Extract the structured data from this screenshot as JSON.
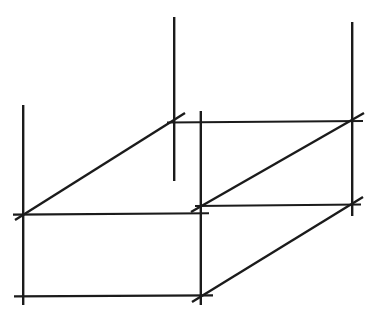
{
  "figure": {
    "projection": "oblique",
    "style": "hand-drawn technical sketch with overshooting construction lines",
    "background_color": "#ffffff",
    "line_color": "#1b1b1b",
    "line_width_px": 2.4,
    "canvas": {
      "width": 374,
      "height": 315
    },
    "vertices": {
      "front_top_left": {
        "x": 23,
        "y": 214
      },
      "front_top_right": {
        "x": 201,
        "y": 214
      },
      "front_bottom_left": {
        "x": 23,
        "y": 296
      },
      "front_bottom_right": {
        "x": 201,
        "y": 296
      },
      "back_top_left": {
        "x": 174,
        "y": 122
      },
      "back_top_right": {
        "x": 352,
        "y": 122
      },
      "back_bottom_left": {
        "x": 201,
        "y": 205
      },
      "back_bottom_right": {
        "x": 352,
        "y": 205
      }
    },
    "edges": [
      {
        "name": "front-face-top-edge",
        "from": "front_top_left",
        "to": "front_top_right",
        "kind": "horizontal"
      },
      {
        "name": "front-face-bottom-edge",
        "from": "front_bottom_left",
        "to": "front_bottom_right",
        "kind": "horizontal"
      },
      {
        "name": "front-face-left-edge",
        "from": "front_top_left",
        "to": "front_bottom_left",
        "kind": "vertical"
      },
      {
        "name": "front-face-right-edge",
        "from": "front_top_right",
        "to": "front_bottom_right",
        "kind": "vertical"
      },
      {
        "name": "back-face-top-edge",
        "from": "back_top_left",
        "to": "back_top_right",
        "kind": "horizontal"
      },
      {
        "name": "back-face-bottom-edge",
        "from": "back_bottom_left",
        "to": "back_bottom_right",
        "kind": "horizontal"
      },
      {
        "name": "back-face-left-edge",
        "from": "back_top_left",
        "to": "back_bottom_left",
        "kind": "vertical"
      },
      {
        "name": "back-face-right-edge",
        "from": "back_top_right",
        "to": "back_bottom_right",
        "kind": "vertical"
      },
      {
        "name": "receding-edge-top-left",
        "from": "front_top_left",
        "to": "back_top_left",
        "kind": "diagonal"
      },
      {
        "name": "receding-edge-top-right",
        "from": "front_top_right",
        "to": "back_top_right",
        "kind": "diagonal"
      },
      {
        "name": "receding-edge-bottom-right",
        "from": "front_bottom_right",
        "to": "back_bottom_right",
        "kind": "diagonal"
      }
    ],
    "construction_overshoots": {
      "description": "Every stroke runs past its corner, as in a freehand drafting sketch",
      "count": 11
    }
  }
}
